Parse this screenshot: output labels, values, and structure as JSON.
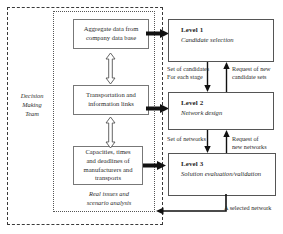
{
  "diagram": {
    "outer_container": {
      "name": "Decision Making Team",
      "caption_lines": "Decision\nMaking\nTeam",
      "caption_line1": "Decision",
      "caption_line2": "Making",
      "caption_line3": "Team",
      "border_style": "dashed",
      "border_color": "#3a3a3a"
    },
    "inner_container": {
      "caption_line1": "Real issues and",
      "caption_line2": "scenario analysis",
      "border_style": "dotted",
      "border_color": "#555555"
    },
    "data_boxes": [
      {
        "id": "aggregate",
        "line1": "Aggregate data from",
        "line2": "company data base"
      },
      {
        "id": "transport",
        "line1": "Transportation and",
        "line2": "information links"
      },
      {
        "id": "capacity",
        "line1": "Capacities, times",
        "line2": "and deadlines of",
        "line3": "manufacturers and",
        "line4": "transports"
      }
    ],
    "levels": [
      {
        "id": "level1",
        "title": "Level 1",
        "subtitle": "Candidate selection"
      },
      {
        "id": "level2",
        "title": "Level 2",
        "subtitle": "Network design"
      },
      {
        "id": "level3",
        "title": "Level 3",
        "subtitle": "Solution evaluation/validation"
      }
    ],
    "edge_labels": [
      {
        "id": "set-of-candidates",
        "line1": "Set of candidates",
        "line2": "For each stage"
      },
      {
        "id": "request-candidate-sets",
        "line1": "Request of new",
        "line2": "candidate sets"
      },
      {
        "id": "set-of-networks",
        "line1": "Set of networks",
        "line2": ""
      },
      {
        "id": "request-new-networks",
        "line1": "Request of",
        "line2": "new networks"
      },
      {
        "id": "selected-network",
        "line1": "A selected network",
        "line2": ""
      }
    ],
    "arrows": {
      "thick_feed_color": "#111111",
      "hollow_fill": "#ffffff",
      "hollow_stroke": "#555555",
      "thin_color": "#111111"
    }
  }
}
